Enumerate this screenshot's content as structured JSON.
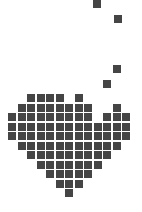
{
  "graphic": {
    "title": "pixel heart",
    "color": "#454545",
    "background": "#ffffff",
    "cell_size": 8,
    "pitch": 9.5,
    "origin": {
      "x": 8,
      "y": 94
    },
    "heart_rows": [
      [
        2,
        3,
        4,
        5,
        7
      ],
      [
        1,
        2,
        3,
        4,
        5,
        6,
        7,
        8,
        11
      ],
      [
        0,
        1,
        2,
        3,
        4,
        5,
        6,
        7,
        8,
        10,
        11,
        12
      ],
      [
        0,
        1,
        2,
        3,
        4,
        5,
        6,
        7,
        8,
        9,
        10,
        11,
        12
      ],
      [
        0,
        1,
        2,
        3,
        4,
        5,
        6,
        7,
        8,
        9,
        10,
        11,
        12
      ],
      [
        1,
        2,
        3,
        4,
        5,
        6,
        7,
        8,
        9,
        10,
        11
      ],
      [
        2,
        3,
        4,
        5,
        6,
        7,
        8,
        9,
        10
      ],
      [
        3,
        4,
        5,
        6,
        7,
        8,
        9
      ],
      [
        4,
        5,
        6,
        7,
        8
      ],
      [
        5,
        6,
        7
      ],
      [
        6
      ]
    ],
    "scattered_pixels": [
      {
        "x": 93,
        "y": 0
      },
      {
        "x": 114,
        "y": 15
      },
      {
        "x": 113,
        "y": 65
      },
      {
        "x": 103,
        "y": 80
      }
    ]
  }
}
